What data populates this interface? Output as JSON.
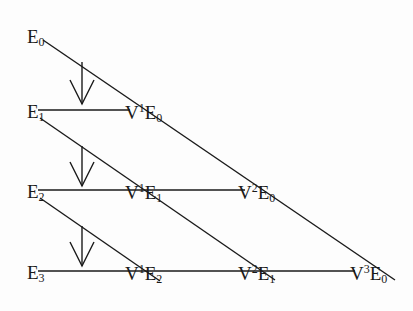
{
  "diagram": {
    "row_labels": [
      {
        "base": "E",
        "sub": "0"
      },
      {
        "base": "E",
        "sub": "1"
      },
      {
        "base": "E",
        "sub": "2"
      },
      {
        "base": "E",
        "sub": "3"
      }
    ],
    "nodes": [
      {
        "op": "V",
        "sup": "1",
        "base": "E",
        "sub": "0"
      },
      {
        "op": "V",
        "sup": "1",
        "base": "E",
        "sub": "1"
      },
      {
        "op": "V",
        "sup": "2",
        "base": "E",
        "sub": "0"
      },
      {
        "op": "V",
        "sup": "1",
        "base": "E",
        "sub": "2"
      },
      {
        "op": "V",
        "sup": "2",
        "base": "E",
        "sub": "1"
      },
      {
        "op": "V",
        "sup": "3",
        "base": "E",
        "sub": "0"
      }
    ],
    "arrows": [
      "down-arrow",
      "down-arrow",
      "down-arrow"
    ]
  }
}
